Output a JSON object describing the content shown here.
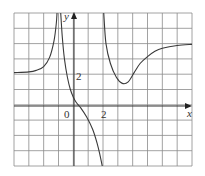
{
  "chart_data": {
    "type": "line",
    "title": "",
    "xlabel": "x",
    "ylabel": "y",
    "xlim": [
      -4,
      8
    ],
    "ylim": [
      -4,
      6
    ],
    "grid": true,
    "grid_spacing": 1,
    "tick_labels": {
      "origin": "0",
      "x": [
        {
          "value": 2,
          "label": "2"
        }
      ],
      "y": [
        {
          "value": 2,
          "label": "2"
        }
      ]
    },
    "vertical_asymptotes": [
      -1,
      2
    ],
    "horizontal_asymptotes": [
      {
        "side": "left",
        "y": 2.1
      },
      {
        "side": "right",
        "y": 4
      }
    ],
    "series": [
      {
        "name": "left-branch",
        "points": [
          [
            -4,
            2.1
          ],
          [
            -3,
            2.15
          ],
          [
            -2.5,
            2.25
          ],
          [
            -2,
            2.5
          ],
          [
            -1.6,
            3.1
          ],
          [
            -1.3,
            4.2
          ],
          [
            -1.15,
            5.3
          ],
          [
            -1.1,
            6
          ]
        ]
      },
      {
        "name": "middle-branch",
        "points": [
          [
            -0.85,
            6
          ],
          [
            -0.75,
            4.5
          ],
          [
            -0.6,
            3
          ],
          [
            -0.4,
            1.8
          ],
          [
            -0.2,
            1
          ],
          [
            0,
            0.5
          ],
          [
            0.2,
            0.15
          ],
          [
            0.5,
            -0.2
          ],
          [
            0.9,
            -0.8
          ],
          [
            1.3,
            -1.6
          ],
          [
            1.6,
            -2.5
          ],
          [
            1.8,
            -3.3
          ],
          [
            1.95,
            -4
          ]
        ]
      },
      {
        "name": "right-branch",
        "points": [
          [
            2.05,
            6
          ],
          [
            2.2,
            4
          ],
          [
            2.5,
            2.7
          ],
          [
            2.9,
            1.8
          ],
          [
            3.3,
            1.4
          ],
          [
            3.7,
            1.5
          ],
          [
            4.1,
            2.1
          ],
          [
            4.5,
            2.7
          ],
          [
            5,
            3.15
          ],
          [
            5.5,
            3.5
          ],
          [
            6,
            3.7
          ],
          [
            7,
            3.88
          ],
          [
            8,
            3.95
          ]
        ]
      }
    ]
  },
  "labels": {
    "y_axis": "y",
    "x_axis": "x",
    "origin": "0",
    "x_tick_2": "2",
    "y_tick_2": "2"
  }
}
